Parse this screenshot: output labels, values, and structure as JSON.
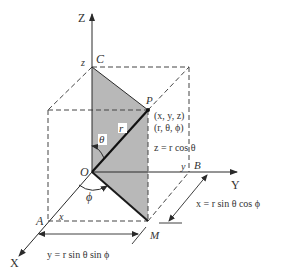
{
  "colors": {
    "line": "#2a2a2a",
    "dash": "#444444",
    "plane_fill": "#b8b8b8",
    "text": "#333333"
  },
  "axes": {
    "z_label": "Z",
    "y_label": "Y",
    "x_label": "X"
  },
  "points": {
    "C": "C",
    "P": "P",
    "O": "O",
    "B": "B",
    "A": "A",
    "M": "M"
  },
  "coordinate_ticks": {
    "z": "z",
    "y": "y",
    "x": "x"
  },
  "point_p_coords": {
    "cartesian": "(x, y, z)",
    "spherical": "(r, θ, ϕ)"
  },
  "segment_labels": {
    "r": "r",
    "theta": "θ",
    "phi": "ϕ"
  },
  "equations": {
    "z": "z = r  cos θ",
    "x": "x = r  sin θ cos ϕ",
    "y": "y = r  sin θ sin ϕ"
  }
}
